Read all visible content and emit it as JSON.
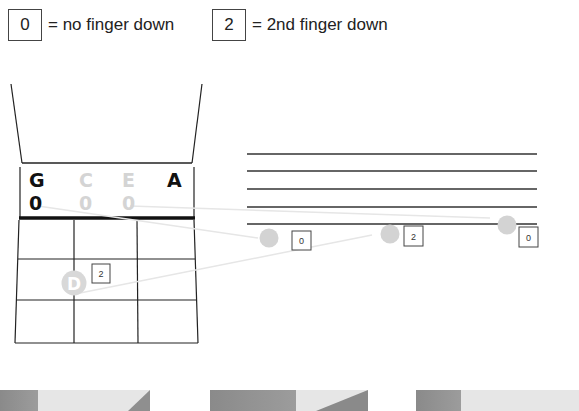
{
  "legend": [
    {
      "box": "0",
      "text": "= no finger down"
    },
    {
      "box": "2",
      "text": "= 2nd finger down"
    }
  ],
  "fingerboard": {
    "strings": [
      {
        "name": "G",
        "finger": "0",
        "active": true
      },
      {
        "name": "C",
        "finger": "0",
        "active": false
      },
      {
        "name": "E",
        "finger": "0",
        "active": false
      },
      {
        "name": "A",
        "finger": "",
        "active": true
      }
    ],
    "note_dot": {
      "label": "D",
      "finger_box": "2"
    }
  },
  "staff": {
    "notes": [
      {
        "finger": "0"
      },
      {
        "finger": "2"
      },
      {
        "finger": "0"
      }
    ]
  },
  "colors": {
    "line": "#222222",
    "inactive": "#d4d4d4",
    "dot": "#d3d3d3",
    "arrow": "#e8e8e8"
  }
}
